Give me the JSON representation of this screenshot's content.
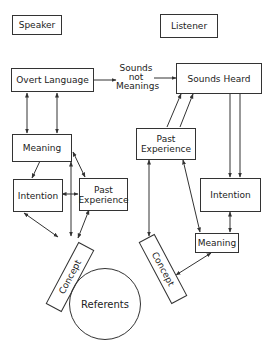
{
  "speaker": {
    "title": "Speaker",
    "overt_language": "Overt Language",
    "meaning": "Meaning",
    "intention": "Intention",
    "past_experience": "Past Experience",
    "concept": "Concept"
  },
  "channel": {
    "label_line1": "Sounds",
    "label_line2": "not",
    "label_line3": "Meanings"
  },
  "listener": {
    "title": "Listener",
    "sounds_heard": "Sounds Heard",
    "past_experience": "Past Experience",
    "intention": "Intention",
    "meaning": "Meaning",
    "concept": "Concept"
  },
  "referents": "Referents",
  "colors": {
    "line": "#333333",
    "background": "#ffffff"
  }
}
